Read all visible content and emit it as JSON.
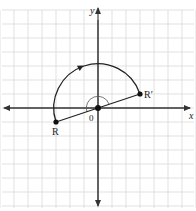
{
  "diagram": {
    "type": "coordinate-plane-rotation",
    "axes": {
      "x_label": "x",
      "y_label": "y"
    },
    "origin_label": "0",
    "grid": {
      "unit_px": 14,
      "origin_px": [
        98,
        108
      ],
      "x_range": [
        -7,
        7
      ],
      "y_range": [
        -7,
        7
      ]
    },
    "points": [
      {
        "name": "R",
        "label": "R",
        "coords": [
          -3,
          -1
        ]
      },
      {
        "name": "R-prime",
        "label": "R′",
        "coords": [
          3,
          1
        ]
      }
    ],
    "rotation": {
      "center": [
        0,
        0
      ],
      "angle_deg": 180,
      "direction": "clockwise",
      "arc_radius_units": 3.162
    },
    "colors": {
      "grid": "#d9d9d9",
      "axis": "#333333",
      "figure": "#222222",
      "background": "#ffffff"
    }
  }
}
